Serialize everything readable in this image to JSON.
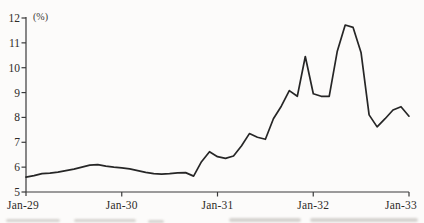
{
  "figure": {
    "unit_label": "(%)",
    "line_color": "#262626",
    "axis_color": "#3a3a3a",
    "text_color": "#2e2b28",
    "background": "#fcfbfa"
  },
  "chart_data": {
    "type": "line",
    "title": "",
    "xlabel": "",
    "ylabel": "(%)",
    "ylim": [
      5,
      12
    ],
    "grid": false,
    "legend_position": "none",
    "y_ticks": [
      12,
      11,
      10,
      9,
      8,
      7,
      6,
      5
    ],
    "x_ticks": [
      "Jan-29",
      "Jan-30",
      "Jan-31",
      "Jan-32",
      "Jan-33"
    ],
    "x": [
      "Jan-29",
      "Feb-29",
      "Mar-29",
      "Apr-29",
      "May-29",
      "Jun-29",
      "Jul-29",
      "Aug-29",
      "Sep-29",
      "Oct-29",
      "Nov-29",
      "Dec-29",
      "Jan-30",
      "Feb-30",
      "Mar-30",
      "Apr-30",
      "May-30",
      "Jun-30",
      "Jul-30",
      "Aug-30",
      "Sep-30",
      "Oct-30",
      "Nov-30",
      "Dec-30",
      "Jan-31",
      "Feb-31",
      "Mar-31",
      "Apr-31",
      "May-31",
      "Jun-31",
      "Jul-31",
      "Aug-31",
      "Sep-31",
      "Oct-31",
      "Nov-31",
      "Dec-31",
      "Jan-32",
      "Feb-32",
      "Mar-32",
      "Apr-32",
      "May-32",
      "Jun-32",
      "Jul-32",
      "Aug-32",
      "Sep-32",
      "Oct-32",
      "Nov-32",
      "Dec-32",
      "Jan-33"
    ],
    "series": [
      {
        "name": "interest-rate-percent",
        "values": [
          5.6,
          5.66,
          5.74,
          5.76,
          5.8,
          5.86,
          5.92,
          6.0,
          6.08,
          6.1,
          6.04,
          6.0,
          5.97,
          5.93,
          5.86,
          5.79,
          5.74,
          5.72,
          5.74,
          5.77,
          5.78,
          5.64,
          6.22,
          6.62,
          6.42,
          6.35,
          6.45,
          6.85,
          7.35,
          7.2,
          7.12,
          7.95,
          8.45,
          9.08,
          8.85,
          10.45,
          8.95,
          8.85,
          8.85,
          10.65,
          11.72,
          11.62,
          10.6,
          8.1,
          7.62,
          7.95,
          8.3,
          8.43,
          8.05
        ]
      }
    ]
  }
}
